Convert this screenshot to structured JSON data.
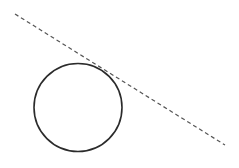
{
  "diagram": {
    "canvas": {
      "width": 239,
      "height": 168,
      "background": "#ffffff"
    },
    "circle": {
      "cx": 78,
      "cy": 107.5,
      "r": 44,
      "stroke": "#2b2b2b",
      "stroke_width": 1.6
    },
    "tangent_line": {
      "x1": 15,
      "y1": 14,
      "x2": 225,
      "y2": 145,
      "stroke": "#555555",
      "stroke_width": 1.2,
      "dash": "4 3"
    }
  }
}
